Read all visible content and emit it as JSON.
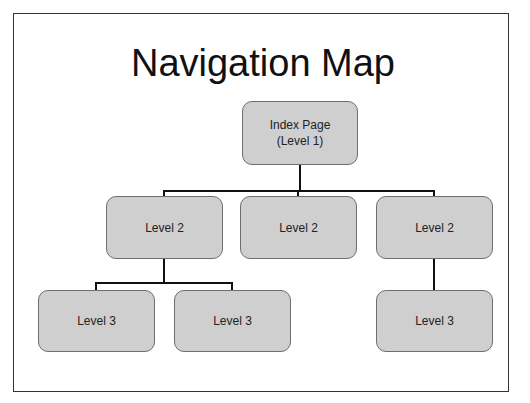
{
  "title": "Navigation Map",
  "nodes": {
    "index": {
      "line1": "Index Page",
      "line2": "(Level 1)"
    },
    "level2": [
      {
        "label": "Level 2"
      },
      {
        "label": "Level 2"
      },
      {
        "label": "Level 2"
      }
    ],
    "level3": [
      {
        "label": "Level 3"
      },
      {
        "label": "Level 3"
      },
      {
        "label": "Level 3"
      }
    ]
  },
  "colors": {
    "node_fill": "#cfcfcf",
    "node_border": "#6e6e6e",
    "connector": "#111111"
  }
}
